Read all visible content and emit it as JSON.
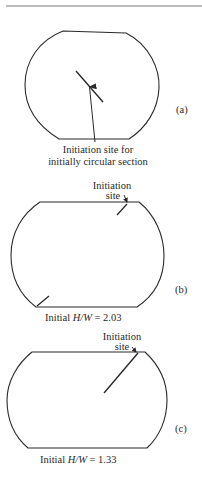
{
  "figure": {
    "panels": [
      {
        "id": "a",
        "label": "(a)",
        "annotation_line1": "Initiation site for",
        "annotation_line2": "initially circular section"
      },
      {
        "id": "b",
        "label": "(b)",
        "annotation_line1": "Initiation",
        "annotation_line2": "site",
        "caption_prefix": "Initial ",
        "caption_ratio": "H/W",
        "caption_value": " = 2.03"
      },
      {
        "id": "c",
        "label": "(c)",
        "annotation_line1": "Initiation",
        "annotation_line2": "site",
        "caption_prefix": "Initial ",
        "caption_ratio": "H/W",
        "caption_value": " = 1.33"
      }
    ],
    "stroke_color": "#2a2a2a"
  }
}
